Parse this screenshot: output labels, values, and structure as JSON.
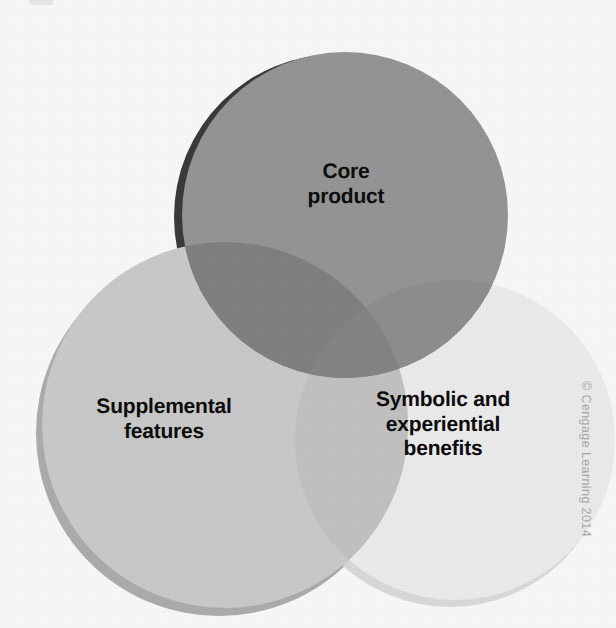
{
  "figure": {
    "background_color": "#f7f7f7",
    "label_color": "#0d0d0d"
  },
  "venn": {
    "circles": [
      {
        "id": "core-product",
        "label": "Core\nproduct",
        "label_line_1": "Core",
        "label_line_2": "product",
        "position": "top",
        "fill_color": "#949494",
        "shadow_color": "#3a3a3a",
        "cx": 345,
        "cy": 215,
        "r": 163
      },
      {
        "id": "supplemental-features",
        "label": "Supplemental\nfeatures",
        "label_line_1": "Supplemental",
        "label_line_2": "features",
        "position": "bottom-left",
        "fill_color": "#c8c8c8",
        "shadow_color": "#9a9a9a",
        "cx": 225,
        "cy": 425,
        "r": 183
      },
      {
        "id": "symbolic-experiential-benefits",
        "label": "Symbolic and\nexperiential\nbenefits",
        "label_line_1": "Symbolic and",
        "label_line_2": "experiential",
        "label_line_3": "benefits",
        "position": "bottom-right",
        "fill_color": "#eaeaea",
        "shadow_color": "#d2d2d2",
        "cx": 455,
        "cy": 440,
        "r": 160
      }
    ],
    "overlap_colors": {
      "core_and_supplemental": "#7f7f7f",
      "core_and_symbolic": "#8d8d8d",
      "supplemental_and_symbolic": "#c0c0c0",
      "all_three": "#838383"
    }
  },
  "credit": {
    "text": "© Cengage Learning 2014",
    "color": "#a8a8a8"
  }
}
